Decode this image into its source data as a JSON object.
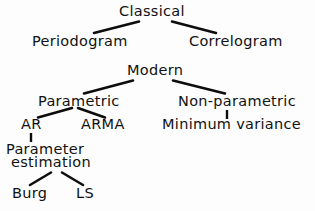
{
  "diagram": {
    "background_color": "#fdfdfd",
    "line_color": "#0d0d0d",
    "text_color": "#111111",
    "nodes": {
      "classical": "Classical",
      "periodogram": "Periodogram",
      "correlogram": "Correlogram",
      "modern": "Modern",
      "parametric": "Parametric",
      "non_parametric": "Non-parametric",
      "ar": "AR",
      "arma": "ARMA",
      "minimum_variance": "Minimum  variance",
      "parameter": "Parameter",
      "estimation": "estimation",
      "burg": "Burg",
      "ls": "LS"
    },
    "edges": [
      {
        "from": "classical",
        "to": "periodogram",
        "type": "diagonal"
      },
      {
        "from": "classical",
        "to": "correlogram",
        "type": "diagonal"
      },
      {
        "from": "modern",
        "to": "parametric",
        "type": "diagonal"
      },
      {
        "from": "modern",
        "to": "non_parametric",
        "type": "diagonal"
      },
      {
        "from": "parametric",
        "to": "ar",
        "type": "diagonal"
      },
      {
        "from": "parametric",
        "to": "arma",
        "type": "diagonal"
      },
      {
        "from": "non_parametric",
        "to": "minimum_variance",
        "type": "vertical"
      },
      {
        "from": "ar",
        "to": "parameter_estimation",
        "type": "vertical"
      },
      {
        "from": "parameter_estimation",
        "to": "burg",
        "type": "diagonal"
      },
      {
        "from": "parameter_estimation",
        "to": "ls",
        "type": "diagonal"
      }
    ]
  }
}
